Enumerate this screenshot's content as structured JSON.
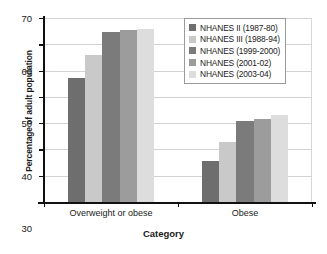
{
  "chart_data": {
    "type": "bar",
    "title": "",
    "xlabel": "Category",
    "ylabel": "Percentage of adult population",
    "categories": [
      "Overweight or obese",
      "Obese"
    ],
    "ylim": [
      0,
      70
    ],
    "yticks": [
      0,
      10,
      20,
      30,
      40,
      50,
      60,
      70
    ],
    "grid": true,
    "legend_position": "top-right",
    "series": [
      {
        "name": "NHANES II (1987-80)",
        "values": [
          47,
          15.5
        ],
        "color": "#6e6e6e"
      },
      {
        "name": "NHANES III (1988-94)",
        "values": [
          56,
          23
        ],
        "color": "#c9c9c9"
      },
      {
        "name": "NHANES (1999-2000)",
        "values": [
          64.5,
          31
        ],
        "color": "#7b7b7b"
      },
      {
        "name": "NHANES (2001-02)",
        "values": [
          65.5,
          31.5
        ],
        "color": "#9c9c9c"
      },
      {
        "name": "NHANES (2003-04)",
        "values": [
          66,
          33
        ],
        "color": "#dddddd"
      }
    ]
  }
}
